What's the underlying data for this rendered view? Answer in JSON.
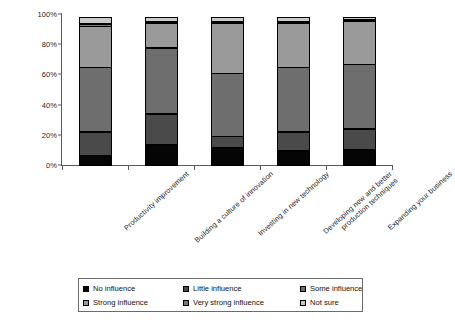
{
  "chart_data": {
    "type": "bar",
    "subtype": "stacked-100-percent",
    "title": "",
    "subtitle": "",
    "xlabel": "",
    "ylabel": "",
    "ylim": [
      0,
      100
    ],
    "ytick_labels": [
      "0%",
      "20%",
      "40%",
      "60%",
      "80%",
      "100%"
    ],
    "ytick_values": [
      0,
      20,
      40,
      60,
      80,
      100
    ],
    "grid": false,
    "legend_position": "bottom",
    "orientation": "vertical",
    "categories": [
      "Productivity improvement",
      "Building a culture of innovation",
      "Investing in new technology",
      "Developing new and better\nproduction techniques",
      "Expanding your business"
    ],
    "series": [
      {
        "name": "No influence",
        "color": "#050505",
        "values": [
          7,
          14,
          12,
          10,
          11
        ]
      },
      {
        "name": "Little influence",
        "color": "#4a4a4a",
        "values": [
          16,
          21,
          8,
          13,
          14
        ]
      },
      {
        "name": "Some influence",
        "color": "#6e6e6e",
        "values": [
          43,
          44,
          42,
          43,
          43
        ]
      },
      {
        "name": "Strong influence",
        "color": "#9a9a9a",
        "values": [
          28,
          17,
          34,
          30,
          29
        ]
      },
      {
        "name": "Very strong influence",
        "color": "#787878",
        "values": [
          2,
          1,
          1,
          1,
          1
        ]
      },
      {
        "name": "Not sure",
        "color": "#c9c9c9",
        "values": [
          4,
          3,
          3,
          3,
          2
        ]
      }
    ]
  },
  "legend": {
    "items": [
      {
        "label": "No influence"
      },
      {
        "label": "Little influence"
      },
      {
        "label": "Some influence"
      },
      {
        "label": "Strong influence"
      },
      {
        "label": "Very strong influence"
      },
      {
        "label": "Not sure"
      }
    ]
  }
}
